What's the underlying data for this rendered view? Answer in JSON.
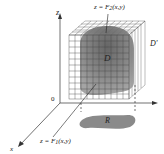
{
  "diagram": {
    "labels": {
      "z_axis": "z",
      "x_axis": "x",
      "origin": "0",
      "top_surface_prefix": "z = F",
      "top_surface_sub": "2",
      "top_surface_suffix": "(x,y)",
      "bottom_surface_prefix": "z = F",
      "bottom_surface_sub": "1",
      "bottom_surface_suffix": "(x,y)",
      "solid": "D",
      "box": "D'",
      "region": "R"
    },
    "colors": {
      "axis": "#333333",
      "grid": "#444444",
      "solid_fill": "#7a7a7a",
      "solid_dark": "#5a5a5a",
      "region_fill": "#8a8a8a"
    }
  }
}
